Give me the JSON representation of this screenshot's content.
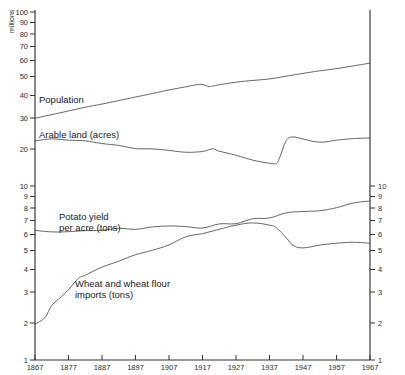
{
  "chart_data": {
    "type": "line",
    "title": "",
    "xlabel": "",
    "ylabel": "millions",
    "scale": "log",
    "grid": false,
    "legend": "inline-labels",
    "xlim": [
      1867,
      1967
    ],
    "ylim": [
      1,
      100
    ],
    "x_ticks": [
      "1867",
      "1877",
      "1887",
      "1897",
      "1907",
      "1917",
      "1927",
      "1937",
      "1947",
      "1957",
      "1967"
    ],
    "y_ticks_left": [
      "1",
      "2",
      "3",
      "4",
      "5",
      "6",
      "7",
      "8",
      "9",
      "10",
      "20",
      "30",
      "40",
      "50",
      "60",
      "70",
      "80",
      "90",
      "100"
    ],
    "y_ticks_right": [
      "1",
      "2",
      "3",
      "4",
      "5",
      "6",
      "7",
      "8",
      "9",
      "10"
    ],
    "series": [
      {
        "name": "Population",
        "label": "Population",
        "units": "millions",
        "x": [
          1867,
          1872,
          1877,
          1882,
          1887,
          1892,
          1897,
          1902,
          1907,
          1912,
          1915,
          1917,
          1919,
          1921,
          1927,
          1932,
          1937,
          1942,
          1947,
          1952,
          1957,
          1962,
          1967
        ],
        "values": [
          24.5,
          25.8,
          27.0,
          28.3,
          29.6,
          31.0,
          32.4,
          34.0,
          35.6,
          37.2,
          38.0,
          38.3,
          37.4,
          37.9,
          39.4,
          40.5,
          41.4,
          42.8,
          44.4,
          45.8,
          47.4,
          49.0,
          50.8
        ]
      },
      {
        "name": "Arable land",
        "label": "Arable land (acres)",
        "units": "millions of acres",
        "x": [
          1867,
          1872,
          1877,
          1882,
          1887,
          1892,
          1897,
          1902,
          1907,
          1912,
          1917,
          1920,
          1922,
          1927,
          1932,
          1937,
          1939,
          1940,
          1942,
          1944,
          1947,
          1952,
          1957,
          1962,
          1967
        ],
        "values": [
          18.2,
          18.6,
          18.4,
          18.0,
          17.4,
          17.0,
          16.5,
          16.2,
          15.9,
          15.5,
          15.9,
          16.3,
          15.8,
          15.0,
          14.1,
          13.4,
          13.4,
          14.6,
          18.3,
          19.2,
          18.6,
          18.0,
          18.3,
          18.6,
          18.9
        ]
      },
      {
        "name": "Potato yield per acre",
        "label": "Potato  yield\nper  acre (tons)",
        "units": "tons per acre",
        "x": [
          1867,
          1872,
          1877,
          1882,
          1887,
          1892,
          1897,
          1902,
          1907,
          1912,
          1917,
          1922,
          1927,
          1932,
          1937,
          1942,
          1947,
          1952,
          1957,
          1962,
          1967
        ],
        "values": [
          5.6,
          5.5,
          5.4,
          5.6,
          5.6,
          5.7,
          5.6,
          5.8,
          5.9,
          5.9,
          5.7,
          6.0,
          6.1,
          6.4,
          6.6,
          7.0,
          7.1,
          7.3,
          7.6,
          7.9,
          8.2
        ]
      },
      {
        "name": "Wheat and wheat flour imports",
        "label": "Wheat and wheat flour\nimports (tons)",
        "units": "millions of tons",
        "x": [
          1867,
          1870,
          1872,
          1875,
          1877,
          1880,
          1882,
          1887,
          1892,
          1897,
          1902,
          1907,
          1912,
          1917,
          1922,
          1927,
          1932,
          1937,
          1939,
          1942,
          1944,
          1947,
          1952,
          1957,
          1962,
          1967
        ],
        "values": [
          1.62,
          1.75,
          2.05,
          2.35,
          2.55,
          2.95,
          3.05,
          3.4,
          3.7,
          4.05,
          4.3,
          4.6,
          5.1,
          5.3,
          5.6,
          5.9,
          6.1,
          6.0,
          5.7,
          5.0,
          4.6,
          4.4,
          4.6,
          4.65,
          4.7,
          4.65
        ]
      }
    ],
    "annotations": [
      {
        "name": "population-label",
        "text": "Population"
      },
      {
        "name": "arable-land-label",
        "text": "Arable  land (acres)"
      },
      {
        "name": "potato-yield-label-line1",
        "text": "Potato  yield"
      },
      {
        "name": "potato-yield-label-line2",
        "text": "per  acre (tons)"
      },
      {
        "name": "wheat-imports-label-line1",
        "text": "Wheat  and  wheat  flour"
      },
      {
        "name": "wheat-imports-label-line2",
        "text": "imports (tons)"
      }
    ]
  },
  "axis": {
    "y_unit_label": "millions",
    "left_ticks": [
      {
        "v": "100",
        "y": 12
      },
      {
        "v": "90",
        "y": 22.5
      },
      {
        "v": "80",
        "y": 34
      },
      {
        "v": "70",
        "y": 46.5
      },
      {
        "v": "60",
        "y": 60.5
      },
      {
        "v": "50",
        "y": 76.5
      },
      {
        "v": "40",
        "y": 95.5
      },
      {
        "v": "30",
        "y": 118
      },
      {
        "v": "20",
        "y": 149
      },
      {
        "v": "10",
        "y": 186
      },
      {
        "v": "9",
        "y": 196.5
      },
      {
        "v": "8",
        "y": 208
      },
      {
        "v": "7",
        "y": 220.5
      },
      {
        "v": "6",
        "y": 234.5
      },
      {
        "v": "5",
        "y": 250.5
      },
      {
        "v": "4",
        "y": 269.5
      },
      {
        "v": "3",
        "y": 292
      },
      {
        "v": "2",
        "y": 323
      },
      {
        "v": "1",
        "y": 360
      }
    ],
    "right_ticks": [
      {
        "v": "10",
        "y": 186
      },
      {
        "v": "9",
        "y": 196.5
      },
      {
        "v": "8",
        "y": 208
      },
      {
        "v": "7",
        "y": 220.5
      },
      {
        "v": "6",
        "y": 234.5
      },
      {
        "v": "5",
        "y": 250.5
      },
      {
        "v": "4",
        "y": 269.5
      },
      {
        "v": "3",
        "y": 292
      },
      {
        "v": "2",
        "y": 323
      },
      {
        "v": "1",
        "y": 360
      }
    ],
    "x_ticks": [
      {
        "v": "1867",
        "x": 35
      },
      {
        "v": "1877",
        "x": 68.5
      },
      {
        "v": "1887",
        "x": 102
      },
      {
        "v": "1897",
        "x": 135.5
      },
      {
        "v": "1907",
        "x": 169
      },
      {
        "v": "1917",
        "x": 202.5
      },
      {
        "v": "1927",
        "x": 236
      },
      {
        "v": "1937",
        "x": 269.5
      },
      {
        "v": "1947",
        "x": 303
      },
      {
        "v": "1957",
        "x": 336.5
      },
      {
        "v": "1967",
        "x": 370
      }
    ]
  },
  "colors": {
    "axis": "#333333",
    "curve": "#4a4a4a",
    "text": "#1a1a1a",
    "background": "#ffffff"
  }
}
